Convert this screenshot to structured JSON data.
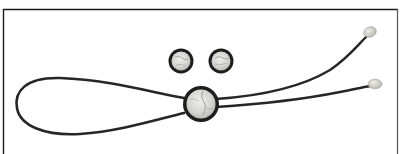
{
  "image": {
    "subject": "Bolo tie with matching pair of cufflinks",
    "alt": "Braided black leather bolo tie with round inlaid slide and two tips, shown with two matching round cufflinks on a white background",
    "background_color": "#ffffff",
    "frame_color": "#1a1a1a",
    "cord_color": "#2a2a2a",
    "bezel_color": "#1e1e1e",
    "inlay_color": "#d9d9d6",
    "tip_color": "#cfcfca"
  },
  "objects": [
    {
      "name": "cufflink-left",
      "cx": 181,
      "cy": 61,
      "r": 13
    },
    {
      "name": "cufflink-right",
      "cx": 221,
      "cy": 61,
      "r": 13
    },
    {
      "name": "bolo-slide",
      "cx": 201,
      "cy": 104,
      "r": 18
    },
    {
      "name": "cord-tip-upper",
      "cx": 370,
      "cy": 32
    },
    {
      "name": "cord-tip-lower",
      "cx": 375,
      "cy": 84
    }
  ]
}
